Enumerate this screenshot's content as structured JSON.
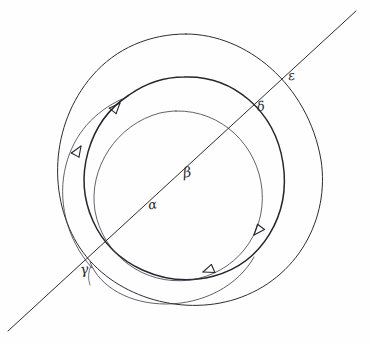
{
  "figure": {
    "kind": "hand-drawn-geometric-diagram",
    "medium": "pen-and-ink sketch on paper",
    "background_color": "#fefefe",
    "ink_color": "#2b2b33",
    "width": 370,
    "height": 344
  },
  "labels": [
    {
      "id": "alpha",
      "text": "α",
      "name": "label-alpha",
      "x": 148,
      "y": 198,
      "rotation_deg": -8,
      "meaning": "point on the diagonal inside the inner circle"
    },
    {
      "id": "beta",
      "text": "β",
      "name": "label-beta",
      "x": 183,
      "y": 165,
      "rotation_deg": -8,
      "meaning": "point on the diagonal near the centre region"
    },
    {
      "id": "gamma",
      "text": "γ",
      "name": "label-gamma",
      "x": 80,
      "y": 262,
      "rotation_deg": -8,
      "meaning": "lower-left crossing of the diagonal with the curves"
    },
    {
      "id": "delta",
      "text": "δ",
      "name": "label-delta",
      "x": 257,
      "y": 100,
      "rotation_deg": -10,
      "meaning": "crossing of the diagonal with the middle circle"
    },
    {
      "id": "epsilon",
      "text": "ε",
      "name": "label-epsilon",
      "x": 288,
      "y": 69,
      "rotation_deg": -10,
      "meaning": "crossing of the diagonal with the outer circle"
    }
  ],
  "geometry": {
    "diagonal_line": {
      "name": "diagonal-line",
      "x1": 8,
      "y1": 331,
      "x2": 356,
      "y2": 11,
      "stroke_width": 1.0
    },
    "circles": [
      {
        "id": "outer",
        "name": "outer-circle",
        "cx": 186,
        "cy": 170,
        "r": 136,
        "stroke_width": 1.0
      },
      {
        "id": "middle",
        "name": "middle-circle",
        "cx": 183,
        "cy": 178,
        "r": 101,
        "stroke_width": 1.4
      },
      {
        "id": "inner",
        "name": "inner-circle",
        "cx": 178,
        "cy": 196,
        "r": 85,
        "stroke_width": 0.8
      }
    ],
    "spirals": [
      {
        "id": "outer-spiral",
        "name": "outer-spiral-curve",
        "stroke_width": 0.8
      },
      {
        "id": "inner-spiral",
        "name": "inner-spiral-curve",
        "stroke_width": 0.8
      }
    ],
    "arrowheads": [
      {
        "id": "arrow-middle-top-left",
        "name": "arrowhead-middle-circle-upper-left",
        "x": 118,
        "y": 104,
        "angle_deg": -52,
        "direction": "counterclockwise / up-right"
      },
      {
        "id": "arrow-spiral-left",
        "name": "arrowhead-outer-spiral-left",
        "x": 79,
        "y": 148,
        "angle_deg": -62,
        "direction": "up-right"
      },
      {
        "id": "arrow-middle-bottom-right",
        "name": "arrowhead-middle-circle-lower-right",
        "x": 252,
        "y": 233,
        "angle_deg": 133,
        "direction": "down-right"
      },
      {
        "id": "arrow-inner-bottom",
        "name": "arrowhead-inner-spiral-bottom",
        "x": 204,
        "y": 271,
        "angle_deg": 163,
        "direction": "down-left"
      }
    ]
  }
}
